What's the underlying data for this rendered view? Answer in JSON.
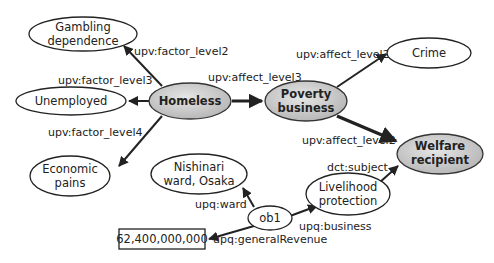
{
  "diagram": {
    "nodes": [
      {
        "id": "gambling",
        "lines": [
          "Gambling",
          "dependence"
        ],
        "style": "plain"
      },
      {
        "id": "unemployed",
        "lines": [
          "Unemployed"
        ],
        "style": "plain"
      },
      {
        "id": "economic",
        "lines": [
          "Economic",
          "pains"
        ],
        "style": "plain"
      },
      {
        "id": "homeless",
        "lines": [
          "Homeless"
        ],
        "style": "highlighted"
      },
      {
        "id": "poverty",
        "lines": [
          "Poverty",
          "business"
        ],
        "style": "highlighted"
      },
      {
        "id": "crime",
        "lines": [
          "Crime"
        ],
        "style": "plain"
      },
      {
        "id": "welfare",
        "lines": [
          "Welfare",
          "recipient"
        ],
        "style": "highlighted"
      },
      {
        "id": "nishinari",
        "lines": [
          "Nishinari",
          "ward, Osaka"
        ],
        "style": "plain"
      },
      {
        "id": "ob1",
        "lines": [
          "ob1"
        ],
        "style": "plain"
      },
      {
        "id": "livelihood",
        "lines": [
          "Livelihood",
          "protection"
        ],
        "style": "plain"
      },
      {
        "id": "revenue",
        "lines": [
          "62,400,000,000"
        ],
        "style": "literal-box"
      }
    ],
    "edges": [
      {
        "from": "homeless",
        "to": "gambling",
        "label": "upv:factor_level2"
      },
      {
        "from": "homeless",
        "to": "unemployed",
        "label": "upv:factor_level3"
      },
      {
        "from": "homeless",
        "to": "economic",
        "label": "upv:factor_level4"
      },
      {
        "from": "homeless",
        "to": "poverty",
        "label": "upv:affect_level3"
      },
      {
        "from": "poverty",
        "to": "crime",
        "label": "upv:affect_level2"
      },
      {
        "from": "poverty",
        "to": "welfare",
        "label": "upv:affect_level2"
      },
      {
        "from": "livelihood",
        "to": "welfare",
        "label": "dct:subject"
      },
      {
        "from": "ob1",
        "to": "nishinari",
        "label": "upq:ward"
      },
      {
        "from": "ob1",
        "to": "livelihood",
        "label": "upq:business"
      },
      {
        "from": "ob1",
        "to": "revenue",
        "label": "upq:generalRevenue"
      }
    ],
    "colors": {
      "highlight_fill": "#c8c8c8",
      "highlight_fill_light": "#e4e4e4",
      "stroke": "#222222",
      "plain_fill": "#ffffff"
    }
  }
}
